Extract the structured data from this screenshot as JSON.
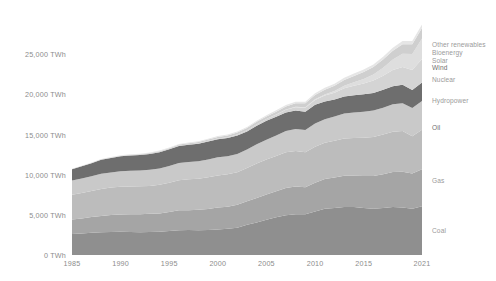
{
  "chart_data": {
    "type": "area",
    "title": "",
    "subtitle": "",
    "xlabel": "",
    "ylabel": "",
    "stacked": true,
    "grid": false,
    "legend_position": "right",
    "xlim": [
      1985,
      2021
    ],
    "ylim": [
      0,
      29500
    ],
    "x": [
      1985,
      1986,
      1987,
      1988,
      1989,
      1990,
      1991,
      1992,
      1993,
      1994,
      1995,
      1996,
      1997,
      1998,
      1999,
      2000,
      2001,
      2002,
      2003,
      2004,
      2005,
      2006,
      2007,
      2008,
      2009,
      2010,
      2011,
      2012,
      2013,
      2014,
      2015,
      2016,
      2017,
      2018,
      2019,
      2020,
      2021
    ],
    "x_ticks": [
      "1985",
      "1990",
      "1995",
      "2000",
      "2005",
      "2010",
      "2015",
      "2021"
    ],
    "x_tick_values": [
      1985,
      1990,
      1995,
      2000,
      2005,
      2010,
      2015,
      2021
    ],
    "y_ticks": [
      "0 TWh",
      "5,000 TWh",
      "10,000 TWh",
      "15,000 TWh",
      "20,000 TWh",
      "25,000 TWh"
    ],
    "y_tick_values": [
      0,
      5000,
      10000,
      15000,
      20000,
      25000
    ],
    "series": [
      {
        "name": "Coal",
        "color": "#8f8f8f",
        "label_y_value": 3000,
        "values": [
          2600,
          2680,
          2760,
          2820,
          2860,
          2880,
          2860,
          2840,
          2860,
          2900,
          3000,
          3080,
          3100,
          3080,
          3100,
          3180,
          3260,
          3400,
          3760,
          4060,
          4400,
          4700,
          4960,
          5080,
          5060,
          5400,
          5760,
          5840,
          5980,
          5980,
          5860,
          5760,
          5840,
          5960,
          5920,
          5760,
          6060
        ]
      },
      {
        "name": "Gas",
        "color": "#a5a5a5",
        "label_y_value": 9200,
        "values": [
          1820,
          1860,
          1960,
          2040,
          2120,
          2160,
          2200,
          2220,
          2260,
          2280,
          2360,
          2480,
          2480,
          2540,
          2620,
          2720,
          2760,
          2860,
          2940,
          3040,
          3140,
          3220,
          3380,
          3440,
          3360,
          3600,
          3700,
          3800,
          3880,
          3900,
          3960,
          4080,
          4200,
          4360,
          4440,
          4380,
          4600
        ]
      },
      {
        "name": "Oil",
        "color": "#bcbcbc",
        "label_y_value": 15800,
        "values": [
          3080,
          3180,
          3260,
          3360,
          3420,
          3440,
          3460,
          3500,
          3480,
          3560,
          3640,
          3740,
          3840,
          3880,
          3960,
          4000,
          4020,
          4040,
          4120,
          4280,
          4360,
          4400,
          4460,
          4440,
          4360,
          4480,
          4520,
          4580,
          4640,
          4680,
          4780,
          4860,
          4960,
          5020,
          5060,
          4640,
          4920
        ]
      },
      {
        "name": "Hydropower",
        "color": "#c9c9c9",
        "label_y_value": 19200,
        "values": [
          1760,
          1800,
          1820,
          1880,
          1880,
          1940,
          1980,
          1960,
          2020,
          2040,
          2080,
          2140,
          2160,
          2180,
          2220,
          2260,
          2240,
          2280,
          2300,
          2400,
          2460,
          2540,
          2620,
          2720,
          2780,
          2900,
          2920,
          3020,
          3120,
          3180,
          3220,
          3280,
          3340,
          3420,
          3460,
          3520,
          3580
        ]
      },
      {
        "name": "Nuclear",
        "color": "#6e6e6e",
        "label_y_value": 21800,
        "values": [
          1400,
          1520,
          1620,
          1760,
          1800,
          1860,
          1900,
          1920,
          1960,
          2020,
          2080,
          2140,
          2140,
          2180,
          2240,
          2260,
          2280,
          2300,
          2260,
          2320,
          2340,
          2340,
          2320,
          2320,
          2280,
          2320,
          2220,
          2100,
          2120,
          2160,
          2180,
          2200,
          2220,
          2260,
          2320,
          2240,
          2320
        ]
      },
      {
        "name": "Wind",
        "color": "#d4d4d4",
        "label_y_value": 23300,
        "values": [
          2,
          3,
          4,
          5,
          7,
          9,
          12,
          15,
          19,
          24,
          30,
          36,
          44,
          54,
          66,
          80,
          96,
          118,
          144,
          176,
          216,
          264,
          330,
          400,
          490,
          600,
          730,
          870,
          1020,
          1180,
          1360,
          1540,
          1760,
          2000,
          2200,
          2480,
          2920
        ]
      },
      {
        "name": "Solar",
        "color": "#dedede",
        "label_y_value": 24200,
        "values": [
          0,
          0,
          0,
          0,
          1,
          1,
          1,
          1,
          2,
          2,
          2,
          3,
          3,
          4,
          5,
          6,
          7,
          9,
          11,
          14,
          18,
          24,
          32,
          44,
          60,
          86,
          130,
          200,
          300,
          420,
          560,
          740,
          1000,
          1320,
          1660,
          2000,
          2560
        ]
      },
      {
        "name": "Bioenergy",
        "color": "#cfcfcf",
        "label_y_value": 25100,
        "values": [
          30,
          34,
          38,
          44,
          50,
          58,
          66,
          74,
          84,
          94,
          106,
          120,
          134,
          150,
          168,
          188,
          208,
          232,
          258,
          288,
          320,
          356,
          396,
          440,
          488,
          540,
          596,
          656,
          720,
          788,
          860,
          930,
          1000,
          1080,
          1160,
          1200,
          1280
        ]
      },
      {
        "name": "Other renewables",
        "color": "#e6e6e6",
        "label_y_value": 26100,
        "values": [
          40,
          42,
          45,
          48,
          52,
          56,
          60,
          64,
          68,
          73,
          78,
          84,
          90,
          96,
          103,
          110,
          118,
          126,
          135,
          145,
          155,
          166,
          178,
          191,
          205,
          220,
          236,
          253,
          271,
          290,
          310,
          332,
          355,
          380,
          406,
          420,
          450
        ]
      }
    ]
  },
  "axis": {
    "y_unit": "TWh"
  }
}
